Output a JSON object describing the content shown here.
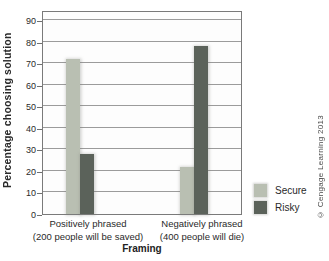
{
  "chart_data": {
    "type": "bar",
    "title": "",
    "categories": [
      {
        "line1": "Positively phrased",
        "line2": "(200 people will be saved)"
      },
      {
        "line1": "Negatively phrased",
        "line2": "(400 people will die)"
      }
    ],
    "series": [
      {
        "name": "Secure",
        "values": [
          72,
          22
        ],
        "color": "#b9bfb2"
      },
      {
        "name": "Risky",
        "values": [
          28,
          78
        ],
        "color": "#5b625a"
      }
    ],
    "xlabel": "Framing",
    "ylabel": "Percentage choosing solution",
    "ylim": [
      0,
      90
    ],
    "ytick_step": 10,
    "yticks": [
      0,
      10,
      20,
      30,
      40,
      50,
      60,
      70,
      80,
      90
    ],
    "grid": true,
    "legend_position": "bottom-right"
  },
  "credit": "© Cengage Learning 2013"
}
